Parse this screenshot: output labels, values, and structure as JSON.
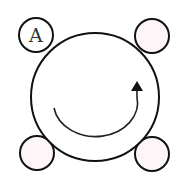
{
  "diagram": {
    "main_circle": {
      "fill": "#ffffff",
      "stroke": "#111111"
    },
    "small_circles": [
      {
        "id": "top-left",
        "label": "A",
        "fill": "#ffffff",
        "stroke": "#111111"
      },
      {
        "id": "top-right",
        "label": "",
        "fill": "#fdf6f8",
        "stroke": "#111111"
      },
      {
        "id": "bottom-left",
        "label": "",
        "fill": "#fdf6f8",
        "stroke": "#111111"
      },
      {
        "id": "bottom-right",
        "label": "",
        "fill": "#fdf6f8",
        "stroke": "#111111"
      }
    ],
    "rotation_arrow": {
      "direction": "counterclockwise",
      "color": "#222222"
    }
  }
}
